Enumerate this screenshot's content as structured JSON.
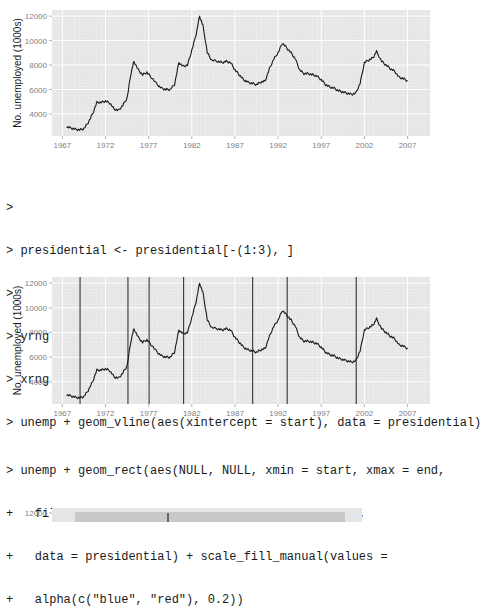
{
  "code_block_1": {
    "lines": [
      ">",
      "> presidential <- presidential[-(1:3), ]",
      ">",
      "> yrng <- range(economics$unemploy)",
      "> xrng <- range(economics$date)",
      "> unemp + geom_vline(aes(xintercept = start), data = presidential)"
    ]
  },
  "code_block_2": {
    "lines": [
      "> unemp + geom_rect(aes(NULL, NULL, xmin = start, xmax = end,",
      "+   fill = party), ymin = yrng[1], ymax = yrng[2],",
      "+   data = presidential) + scale_fill_manual(values =",
      "+   alpha(c(\"blue\", \"red\"), 0.2))"
    ]
  },
  "colors": {
    "panel_bg": "#e5e5e5",
    "grid_major": "#ffffff",
    "grid_minor": "#f2f2f2",
    "line": "#1a1a1a",
    "vline": "#333333",
    "axis_text": "#7f7f7f"
  },
  "chart_data": [
    {
      "type": "line",
      "title": "",
      "xlabel": "",
      "ylabel": "No. unemployed (1000s)",
      "x_ticks": [
        "1967",
        "1972",
        "1977",
        "1982",
        "1987",
        "1992",
        "1997",
        "2002",
        "2007"
      ],
      "y_ticks": [
        "4000",
        "6000",
        "8000",
        "10000",
        "12000"
      ],
      "xlim": [
        1965.8,
        2009.6
      ],
      "ylim": [
        2200,
        12500
      ],
      "grid": true,
      "series": [
        {
          "name": "unemploy",
          "x": [
            1967.5,
            1968,
            1968.5,
            1969,
            1969.5,
            1970,
            1970.5,
            1971,
            1971.5,
            1972,
            1972.5,
            1973,
            1973.5,
            1974,
            1974.5,
            1975,
            1975.3,
            1975.8,
            1976.3,
            1976.8,
            1977.3,
            1978,
            1978.5,
            1979,
            1979.5,
            1980,
            1980.5,
            1981,
            1981.5,
            1982,
            1982.5,
            1982.9,
            1983.3,
            1983.8,
            1984.3,
            1985,
            1985.5,
            1986,
            1986.5,
            1987,
            1987.5,
            1988,
            1988.5,
            1989,
            1989.5,
            1990,
            1990.5,
            1991,
            1991.5,
            1992,
            1992.5,
            1993,
            1993.5,
            1994,
            1994.5,
            1995,
            1995.5,
            1996,
            1996.5,
            1997,
            1997.5,
            1998,
            1998.5,
            1999,
            1999.5,
            2000,
            2000.5,
            2001,
            2001.5,
            2002,
            2002.5,
            2003,
            2003.4,
            2004,
            2004.5,
            2005,
            2005.5,
            2006,
            2006.5,
            2007
          ],
          "values": [
            2950,
            2850,
            2750,
            2700,
            2800,
            3300,
            4000,
            4950,
            4950,
            5050,
            4900,
            4400,
            4300,
            4700,
            5300,
            7500,
            8300,
            7600,
            7200,
            7400,
            7000,
            6400,
            6100,
            6000,
            6000,
            6400,
            8200,
            7900,
            8000,
            9200,
            10500,
            12000,
            11200,
            9000,
            8400,
            8300,
            8200,
            8300,
            8200,
            7600,
            7200,
            6800,
            6600,
            6500,
            6400,
            6600,
            6700,
            7700,
            8500,
            9000,
            9800,
            9400,
            9000,
            8500,
            7600,
            7300,
            7300,
            7200,
            7100,
            6800,
            6400,
            6200,
            6100,
            5900,
            5800,
            5700,
            5600,
            5700,
            6500,
            8200,
            8400,
            8600,
            9100,
            8300,
            8000,
            7700,
            7500,
            7000,
            6900,
            6700
          ]
        }
      ]
    },
    {
      "type": "line",
      "title": "",
      "xlabel": "",
      "ylabel": "No. unemployed (1000s)",
      "x_ticks": [
        "1967",
        "1972",
        "1977",
        "1982",
        "1987",
        "1992",
        "1997",
        "2002",
        "2007"
      ],
      "y_ticks": [
        "4000",
        "6000",
        "8000",
        "10000",
        "12000"
      ],
      "xlim": [
        1965.8,
        2009.6
      ],
      "ylim": [
        2200,
        12500
      ],
      "grid": true,
      "vlines": [
        1969.05,
        1974.6,
        1977.05,
        1981.05,
        1989.05,
        1993.05,
        2001.05
      ],
      "series_ref": "same as chart 1 (unemploy)"
    },
    {
      "type": "line",
      "partial": true,
      "y_ticks": [
        "12000"
      ],
      "note": "top edge of third chart (geom_rect shaded presidential terms) visible only"
    }
  ]
}
